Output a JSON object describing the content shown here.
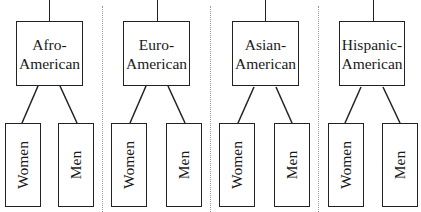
{
  "diagram": {
    "groups": [
      {
        "line1": "Afro-",
        "line2": "American",
        "children": [
          "Women",
          "Men"
        ]
      },
      {
        "line1": "Euro-",
        "line2": "American",
        "children": [
          "Women",
          "Men"
        ]
      },
      {
        "line1": "Asian-",
        "line2": "American",
        "children": [
          "Women",
          "Men"
        ]
      },
      {
        "line1": "Hispanic-",
        "line2": "American",
        "children": [
          "Women",
          "Men"
        ]
      }
    ]
  }
}
